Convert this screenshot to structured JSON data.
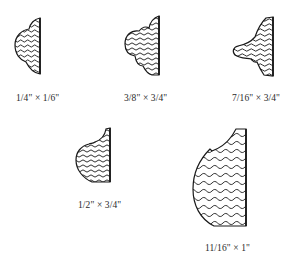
{
  "diagram": {
    "type": "molding-profiles",
    "profiles": [
      {
        "id": "profile-1",
        "label": "1/4\" × 1/6\""
      },
      {
        "id": "profile-2",
        "label": "3/8\" × 3/4\""
      },
      {
        "id": "profile-3",
        "label": "7/16\" × 3/4\""
      },
      {
        "id": "profile-4",
        "label": "1/2\" × 3/4\""
      },
      {
        "id": "profile-5",
        "label": "11/16\" × 1\""
      }
    ],
    "fill_pattern": "wood-grain-wavy-lines",
    "colors": {
      "stroke": "#1a1a1a",
      "background": "#ffffff"
    }
  }
}
